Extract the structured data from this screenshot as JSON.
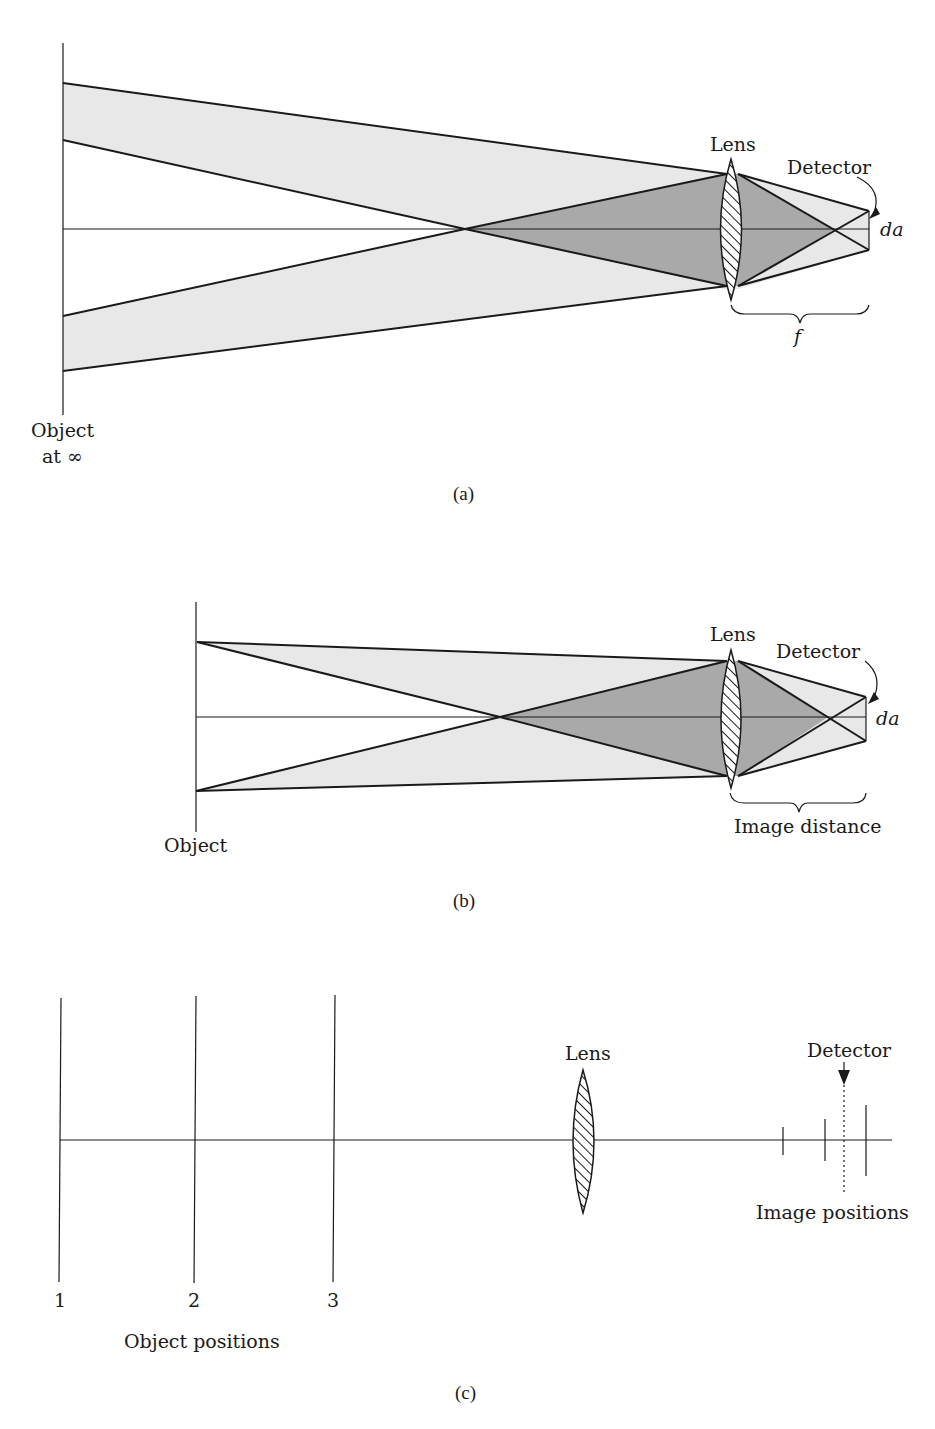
{
  "figure": {
    "panels": [
      {
        "id": "a",
        "caption": "(a)",
        "object_label_line1": "Object",
        "object_label_line2": "at ∞",
        "lens_label": "Lens",
        "detector_label": "Detector",
        "detector_size_label": "da",
        "distance_label": "f"
      },
      {
        "id": "b",
        "caption": "(b)",
        "object_label": "Object",
        "lens_label": "Lens",
        "detector_label": "Detector",
        "detector_size_label": "da",
        "distance_label": "Image distance"
      },
      {
        "id": "c",
        "caption": "(c)",
        "object_position_numbers": [
          "1",
          "2",
          "3"
        ],
        "object_positions_label": "Object positions",
        "lens_label": "Lens",
        "detector_label": "Detector",
        "image_positions_label": "Image positions"
      }
    ],
    "colors": {
      "light_cone": "#e8e8e8",
      "dark_cone": "#a9a9a9",
      "ink": "#1a1a1a"
    }
  }
}
